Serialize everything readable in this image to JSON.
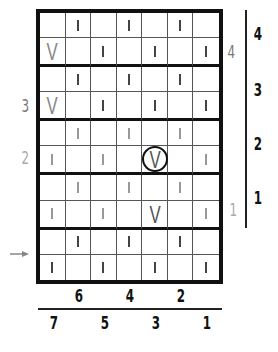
{
  "chart": {
    "type": "knitting-chart",
    "columns": 7,
    "rows": 10,
    "thick_line_after_rows": [
      2,
      4,
      6,
      8
    ],
    "grid": [
      [
        "",
        "bar-dark",
        "",
        "bar-dark",
        "",
        "bar-dark",
        ""
      ],
      [
        "v-light",
        "",
        "bar-dark",
        "",
        "bar-dark",
        "",
        "bar-dark"
      ],
      [
        "",
        "bar-dark",
        "",
        "bar-dark",
        "",
        "bar-dark",
        ""
      ],
      [
        "v-light",
        "",
        "bar-dark",
        "",
        "bar-dark",
        "",
        "bar-dark"
      ],
      [
        "",
        "bar-light",
        "",
        "bar-light",
        "",
        "bar-light",
        ""
      ],
      [
        "bar-light",
        "",
        "bar-light",
        "",
        "v-circled",
        "",
        "bar-light"
      ],
      [
        "",
        "bar-light",
        "",
        "bar-light",
        "",
        "bar-light",
        ""
      ],
      [
        "bar-light",
        "",
        "bar-light",
        "",
        "v-dark",
        "",
        "bar-light"
      ],
      [
        "",
        "bar-dark",
        "",
        "bar-dark",
        "",
        "bar-dark",
        ""
      ],
      [
        "bar-dark",
        "",
        "bar-dark",
        "",
        "bar-dark",
        "",
        "bar-dark"
      ]
    ],
    "v_glyph": "V"
  },
  "labels": {
    "left": [
      {
        "text": "3",
        "style": "gray"
      },
      {
        "text": "2",
        "style": "lightgray"
      }
    ],
    "right_inner": [
      {
        "text": "4",
        "style": "gray"
      },
      {
        "text": "1",
        "style": "lightgray"
      }
    ],
    "right_outer": [
      "4",
      "3",
      "2",
      "1"
    ],
    "bottom_top_row": [
      "6",
      "4",
      "2"
    ],
    "bottom_bottom_row": [
      "7",
      "5",
      "3",
      "1"
    ]
  },
  "arrow": {
    "direction": "right",
    "row": 10
  }
}
